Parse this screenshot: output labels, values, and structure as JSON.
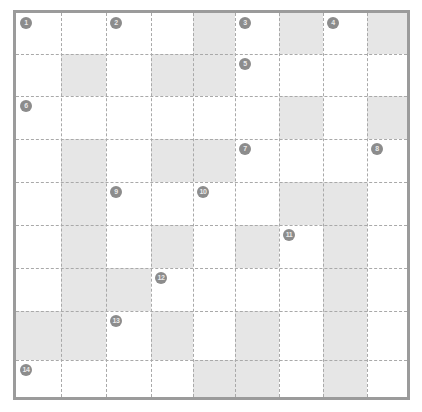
{
  "grid": {
    "columns": 9,
    "rows": 9,
    "column_edges": [
      0,
      45,
      90,
      135,
      177,
      219,
      263,
      307,
      351,
      391
    ],
    "row_edges": [
      0,
      41,
      83,
      126,
      169,
      212,
      255,
      298,
      347,
      384
    ],
    "border_color": "#9b9b9b",
    "gridline_color": "#a9a9a9",
    "shaded_cell_color": "#e6e6e6",
    "background_color": "#ffffff",
    "shaded_cells": [
      [
        1,
        5
      ],
      [
        1,
        7
      ],
      [
        1,
        9
      ],
      [
        2,
        2
      ],
      [
        2,
        4
      ],
      [
        2,
        5
      ],
      [
        3,
        7
      ],
      [
        3,
        9
      ],
      [
        4,
        2
      ],
      [
        4,
        4
      ],
      [
        4,
        5
      ],
      [
        5,
        2
      ],
      [
        5,
        7
      ],
      [
        5,
        8
      ],
      [
        6,
        2
      ],
      [
        6,
        4
      ],
      [
        6,
        6
      ],
      [
        6,
        8
      ],
      [
        7,
        2
      ],
      [
        7,
        3
      ],
      [
        7,
        8
      ],
      [
        8,
        1
      ],
      [
        8,
        2
      ],
      [
        8,
        4
      ],
      [
        8,
        6
      ],
      [
        8,
        8
      ],
      [
        9,
        5
      ],
      [
        9,
        6
      ],
      [
        9,
        8
      ]
    ]
  },
  "markers": [
    {
      "label": "1",
      "row": 1,
      "col": 1
    },
    {
      "label": "2",
      "row": 1,
      "col": 3
    },
    {
      "label": "3",
      "row": 1,
      "col": 6
    },
    {
      "label": "4",
      "row": 1,
      "col": 8
    },
    {
      "label": "5",
      "row": 2,
      "col": 6
    },
    {
      "label": "6",
      "row": 3,
      "col": 1
    },
    {
      "label": "7",
      "row": 4,
      "col": 6
    },
    {
      "label": "8",
      "row": 4,
      "col": 9
    },
    {
      "label": "9",
      "row": 5,
      "col": 3
    },
    {
      "label": "10",
      "row": 5,
      "col": 5
    },
    {
      "label": "11",
      "row": 6,
      "col": 7
    },
    {
      "label": "12",
      "row": 7,
      "col": 4
    },
    {
      "label": "13",
      "row": 8,
      "col": 3
    },
    {
      "label": "14",
      "row": 9,
      "col": 1
    }
  ]
}
